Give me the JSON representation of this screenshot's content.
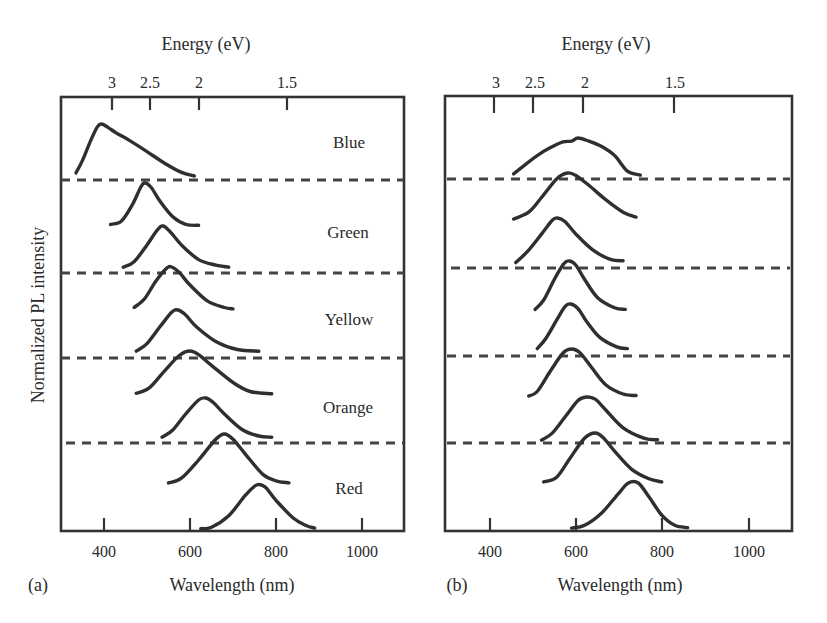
{
  "figure": {
    "panel_labels": [
      "(a)",
      "(b)"
    ]
  },
  "chart_data": [
    {
      "type": "line",
      "panel": "(a)",
      "title": "",
      "xlabel": "Wavelength (nm)",
      "ylabel": "Normalized PL intensity",
      "top_axis_label": "Energy (eV)",
      "xlim": [
        330,
        1100
      ],
      "x_ticks": [
        400,
        600,
        800,
        1000
      ],
      "top_ticks": [
        {
          "label": "3",
          "wavelength_nm": 413
        },
        {
          "label": "2.5",
          "wavelength_nm": 496
        },
        {
          "label": "2",
          "wavelength_nm": 620
        },
        {
          "label": "1.5",
          "wavelength_nm": 827
        }
      ],
      "grid": false,
      "stack_separators": "dashed",
      "groups": [
        {
          "name": "Blue",
          "label_text": "Blue"
        },
        {
          "name": "Green",
          "label_text": "Green"
        },
        {
          "name": "Yellow",
          "label_text": "Yellow"
        },
        {
          "name": "Orange",
          "label_text": "Orange"
        },
        {
          "name": "Red",
          "label_text": "Red"
        }
      ],
      "series": [
        {
          "name": "Blue",
          "group": "Blue",
          "peak_nm": 390,
          "x": [
            335,
            350,
            370,
            385,
            395,
            410,
            430,
            460,
            500,
            540,
            580,
            610
          ],
          "y": [
            0.06,
            0.3,
            0.7,
            0.95,
            1.0,
            0.93,
            0.82,
            0.68,
            0.47,
            0.25,
            0.07,
            0.0
          ]
        },
        {
          "name": "Green 1",
          "group": "Green",
          "peak_nm": 495,
          "x": [
            415,
            440,
            465,
            485,
            495,
            510,
            530,
            560,
            590,
            620
          ],
          "y": [
            0.08,
            0.15,
            0.5,
            0.9,
            1.0,
            0.9,
            0.6,
            0.25,
            0.08,
            0.06
          ]
        },
        {
          "name": "Green 2",
          "group": "Green",
          "peak_nm": 535,
          "x": [
            445,
            470,
            500,
            525,
            538,
            555,
            580,
            620,
            660,
            690
          ],
          "y": [
            0.02,
            0.15,
            0.55,
            0.92,
            1.0,
            0.85,
            0.55,
            0.2,
            0.07,
            0.02
          ]
        },
        {
          "name": "Yellow 1",
          "group": "Yellow",
          "peak_nm": 555,
          "x": [
            470,
            495,
            520,
            545,
            557,
            575,
            600,
            640,
            680,
            700
          ],
          "y": [
            0.1,
            0.3,
            0.68,
            0.97,
            1.0,
            0.88,
            0.6,
            0.25,
            0.1,
            0.07
          ]
        },
        {
          "name": "Yellow 2",
          "group": "Yellow",
          "peak_nm": 570,
          "x": [
            475,
            500,
            530,
            558,
            572,
            590,
            615,
            660,
            710,
            760
          ],
          "y": [
            0.02,
            0.2,
            0.6,
            0.95,
            1.0,
            0.88,
            0.6,
            0.25,
            0.06,
            0.02
          ]
        },
        {
          "name": "Orange 1",
          "group": "Orange",
          "peak_nm": 600,
          "x": [
            475,
            505,
            540,
            575,
            600,
            620,
            650,
            700,
            740,
            790
          ],
          "y": [
            0.06,
            0.18,
            0.55,
            0.9,
            1.0,
            0.92,
            0.68,
            0.3,
            0.1,
            0.05
          ]
        },
        {
          "name": "Orange 2",
          "group": "Orange",
          "peak_nm": 635,
          "x": [
            535,
            560,
            590,
            620,
            637,
            655,
            680,
            720,
            760,
            790
          ],
          "y": [
            0.02,
            0.2,
            0.6,
            0.95,
            1.0,
            0.88,
            0.6,
            0.22,
            0.05,
            0.02
          ]
        },
        {
          "name": "Red 1",
          "group": "Red",
          "peak_nm": 680,
          "x": [
            550,
            580,
            620,
            660,
            680,
            700,
            730,
            770,
            800,
            830
          ],
          "y": [
            0.06,
            0.15,
            0.5,
            0.9,
            1.0,
            0.9,
            0.6,
            0.22,
            0.1,
            0.06
          ]
        },
        {
          "name": "Red 2",
          "group": "Red",
          "peak_nm": 760,
          "x": [
            625,
            650,
            690,
            730,
            755,
            775,
            800,
            840,
            870,
            890
          ],
          "y": [
            0.01,
            0.04,
            0.3,
            0.78,
            1.0,
            0.95,
            0.65,
            0.25,
            0.08,
            0.02
          ]
        }
      ]
    },
    {
      "type": "line",
      "panel": "(b)",
      "title": "",
      "xlabel": "Wavelength (nm)",
      "ylabel": "",
      "top_axis_label": "Energy (eV)",
      "xlim": [
        310,
        1090
      ],
      "x_ticks": [
        400,
        600,
        800,
        1000
      ],
      "top_ticks": [
        {
          "label": "3",
          "wavelength_nm": 413
        },
        {
          "label": "2.5",
          "wavelength_nm": 496
        },
        {
          "label": "2",
          "wavelength_nm": 620
        },
        {
          "label": "1.5",
          "wavelength_nm": 827
        }
      ],
      "grid": false,
      "stack_separators": "dashed",
      "series": [
        {
          "name": "Blue (b)",
          "peak_nm": 600,
          "x": [
            455,
            480,
            510,
            540,
            570,
            590,
            605,
            630,
            660,
            690,
            720,
            750
          ],
          "y": [
            0.08,
            0.3,
            0.55,
            0.75,
            0.9,
            0.92,
            1.0,
            0.92,
            0.78,
            0.55,
            0.15,
            0.05
          ]
        },
        {
          "name": "Green 1 (b)",
          "peak_nm": 580,
          "x": [
            455,
            490,
            520,
            555,
            580,
            600,
            630,
            670,
            710,
            740
          ],
          "y": [
            0.06,
            0.2,
            0.5,
            0.88,
            1.0,
            0.95,
            0.75,
            0.45,
            0.2,
            0.1
          ]
        },
        {
          "name": "Green 2 (b)",
          "peak_nm": 555,
          "x": [
            460,
            490,
            520,
            545,
            557,
            575,
            600,
            640,
            680,
            710
          ],
          "y": [
            0.03,
            0.3,
            0.65,
            0.95,
            1.0,
            0.92,
            0.65,
            0.3,
            0.1,
            0.07
          ]
        },
        {
          "name": "Yellow 1 (b)",
          "peak_nm": 585,
          "x": [
            505,
            525,
            550,
            572,
            585,
            600,
            620,
            650,
            690,
            715
          ],
          "y": [
            0.07,
            0.25,
            0.65,
            0.95,
            1.0,
            0.92,
            0.65,
            0.3,
            0.1,
            0.07
          ]
        },
        {
          "name": "Yellow 2 (b)",
          "peak_nm": 588,
          "x": [
            510,
            530,
            555,
            575,
            588,
            605,
            625,
            655,
            695,
            720
          ],
          "y": [
            0.03,
            0.25,
            0.65,
            0.95,
            1.0,
            0.9,
            0.62,
            0.28,
            0.07,
            0.03
          ]
        },
        {
          "name": "Orange 1 (b)",
          "peak_nm": 590,
          "x": [
            490,
            510,
            540,
            570,
            590,
            610,
            635,
            670,
            710,
            740
          ],
          "y": [
            0.06,
            0.15,
            0.55,
            0.92,
            1.0,
            0.92,
            0.65,
            0.28,
            0.1,
            0.07
          ]
        },
        {
          "name": "Orange 2 (b)",
          "peak_nm": 625,
          "x": [
            520,
            545,
            575,
            605,
            625,
            645,
            670,
            710,
            760,
            790
          ],
          "y": [
            0.02,
            0.18,
            0.55,
            0.92,
            1.0,
            0.95,
            0.7,
            0.3,
            0.06,
            0.03
          ]
        },
        {
          "name": "Red 1 (b)",
          "peak_nm": 645,
          "x": [
            525,
            555,
            585,
            620,
            645,
            665,
            690,
            730,
            770,
            800
          ],
          "y": [
            0.06,
            0.15,
            0.5,
            0.9,
            1.0,
            0.9,
            0.65,
            0.3,
            0.12,
            0.06
          ]
        },
        {
          "name": "Red 2 (b)",
          "peak_nm": 730,
          "x": [
            590,
            620,
            660,
            700,
            722,
            745,
            770,
            800,
            830,
            860
          ],
          "y": [
            0.02,
            0.08,
            0.35,
            0.78,
            1.0,
            1.0,
            0.7,
            0.3,
            0.08,
            0.03
          ]
        }
      ]
    }
  ]
}
